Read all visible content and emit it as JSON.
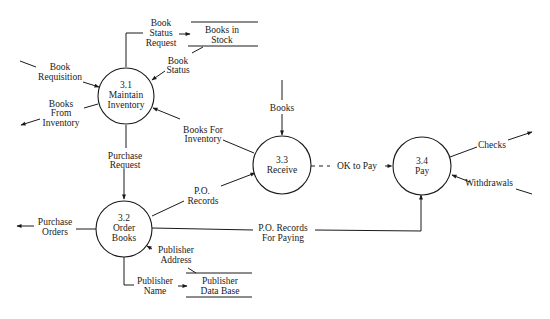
{
  "diagram": {
    "type": "data-flow-diagram",
    "colors": {
      "ink": "#1a1a1a",
      "background": "#ffffff"
    },
    "processes": [
      {
        "id": "3.1",
        "number": "3.1",
        "name_lines": [
          "Maintain",
          "Inventory"
        ]
      },
      {
        "id": "3.2",
        "number": "3.2",
        "name_lines": [
          "Order",
          "Books"
        ]
      },
      {
        "id": "3.3",
        "number": "3.3",
        "name_lines": [
          "Receive"
        ]
      },
      {
        "id": "3.4",
        "number": "3.4",
        "name_lines": [
          "Pay"
        ]
      }
    ],
    "data_stores": [
      {
        "id": "books-in-stock",
        "name_lines": [
          "Books in",
          "Stock"
        ]
      },
      {
        "id": "publisher-db",
        "name_lines": [
          "Publisher",
          "Data Base"
        ]
      }
    ],
    "flows": [
      {
        "id": "book-requisition",
        "label_lines": [
          "Book",
          "Requisition"
        ],
        "from": "external",
        "to": "3.1"
      },
      {
        "id": "books-from-inventory",
        "label_lines": [
          "Books",
          "From",
          "Inventory"
        ],
        "from": "3.1",
        "to": "external"
      },
      {
        "id": "book-status-request",
        "label_lines": [
          "Book",
          "Status",
          "Request"
        ],
        "from": "3.1",
        "to": "books-in-stock"
      },
      {
        "id": "book-status",
        "label_lines": [
          "Book",
          "Status"
        ],
        "from": "books-in-stock",
        "to": "3.1"
      },
      {
        "id": "books-for-inventory",
        "label_lines": [
          "Books For",
          "Inventory"
        ],
        "from": "3.3",
        "to": "3.1"
      },
      {
        "id": "purchase-request",
        "label_lines": [
          "Purchase",
          "Request"
        ],
        "from": "3.1",
        "to": "3.2"
      },
      {
        "id": "purchase-orders",
        "label_lines": [
          "Purchase",
          "Orders"
        ],
        "from": "3.2",
        "to": "external"
      },
      {
        "id": "po-records",
        "label_lines": [
          "P.O.",
          "Records"
        ],
        "from": "3.2",
        "to": "3.3"
      },
      {
        "id": "po-records-for-paying",
        "label_lines": [
          "P.O. Records",
          "For Paying"
        ],
        "from": "3.2",
        "to": "3.4"
      },
      {
        "id": "publisher-address",
        "label_lines": [
          "Publisher",
          "Address"
        ],
        "from": "publisher-db",
        "to": "3.2"
      },
      {
        "id": "publisher-name",
        "label_lines": [
          "Publisher",
          "Name"
        ],
        "from": "3.2",
        "to": "publisher-db"
      },
      {
        "id": "books",
        "label_lines": [
          "Books"
        ],
        "from": "external",
        "to": "3.3"
      },
      {
        "id": "ok-to-pay",
        "label_lines": [
          "OK to Pay"
        ],
        "from": "3.3",
        "to": "3.4",
        "style": "dashed"
      },
      {
        "id": "checks",
        "label_lines": [
          "Checks"
        ],
        "from": "3.4",
        "to": "external"
      },
      {
        "id": "withdrawals",
        "label_lines": [
          "Withdrawals"
        ],
        "from": "external",
        "to": "3.4"
      }
    ]
  }
}
